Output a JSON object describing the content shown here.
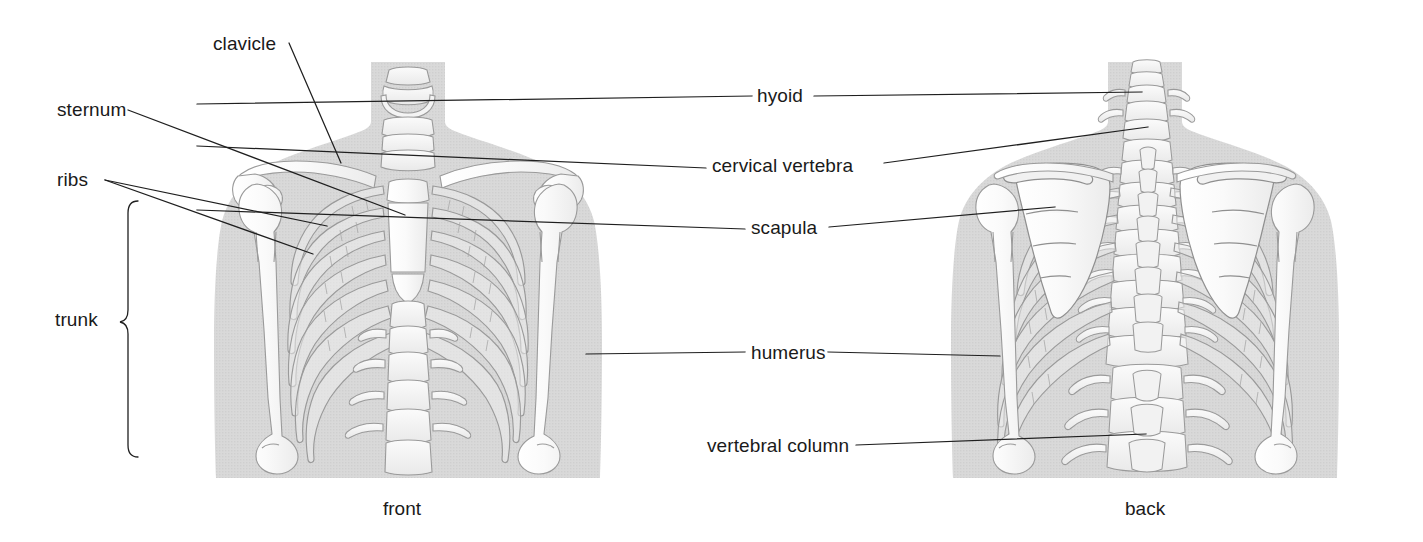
{
  "figure": {
    "background_color": "#ffffff",
    "body_silhouette_color": "#d6d6d6",
    "bone_fill_color": "#f6f6f6",
    "bone_outline_color": "#9a9a9a",
    "leader_line_color": "#1f1f1f",
    "text_color": "#1a1a1a"
  },
  "labels": [
    {
      "id": "clavicle",
      "text": "clavicle",
      "x": 213,
      "y": 33,
      "align": "left"
    },
    {
      "id": "sternum",
      "text": "sternum",
      "x": 57,
      "y": 105,
      "align": "left"
    },
    {
      "id": "ribs",
      "text": "ribs",
      "x": 57,
      "y": 167,
      "align": "left"
    },
    {
      "id": "trunk",
      "text": "trunk",
      "x": 55,
      "y": 318,
      "align": "left"
    },
    {
      "id": "hyoid",
      "text": "hyoid",
      "x": 760,
      "y": 95,
      "align": "left"
    },
    {
      "id": "cervical-vertebra",
      "text": "cervical vertebra",
      "x": 713,
      "y": 158,
      "align": "left"
    },
    {
      "id": "scapula",
      "text": "scapula",
      "x": 752,
      "y": 219,
      "align": "left"
    },
    {
      "id": "humerus",
      "text": "humerus",
      "x": 752,
      "y": 345,
      "align": "left"
    },
    {
      "id": "vertebral-column",
      "text": "vertebral column",
      "x": 708,
      "y": 437,
      "align": "left"
    }
  ],
  "captions": [
    {
      "id": "front",
      "text": "front",
      "x": 385,
      "y": 500
    },
    {
      "id": "back",
      "text": "back",
      "x": 1125,
      "y": 500
    }
  ],
  "views": {
    "front": {
      "name": "front",
      "center_x": 408,
      "left": 215,
      "right": 600
    },
    "back": {
      "name": "back",
      "center_x": 1145,
      "left": 945,
      "right": 1350
    }
  },
  "bracket": {
    "id": "trunk-bracket",
    "label": "trunk",
    "top_y": 200,
    "bottom_y": 458,
    "x": 128
  }
}
